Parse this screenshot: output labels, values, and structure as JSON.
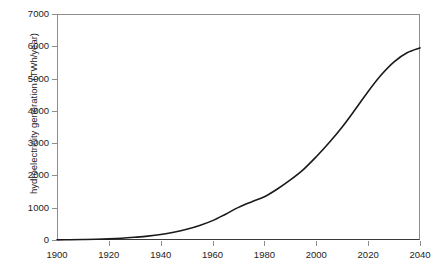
{
  "chart_data": {
    "type": "line",
    "title": "",
    "subtitle": "",
    "xlabel": "",
    "ylabel": "hydroelectricity generation (TWh/year)",
    "xlim": [
      1900,
      2040
    ],
    "ylim": [
      0,
      7000
    ],
    "xticks": [
      1900,
      1920,
      1940,
      1960,
      1980,
      2000,
      2020,
      2040
    ],
    "xtick_labels": [
      "1900",
      "1920",
      "1940",
      "1960",
      "1980",
      "2000",
      "2020",
      "2040"
    ],
    "yticks": [
      0,
      1000,
      2000,
      3000,
      4000,
      5000,
      6000,
      7000
    ],
    "ytick_labels": [
      "0",
      "1000",
      "2000",
      "3000",
      "4000",
      "5000",
      "6000",
      "7000"
    ],
    "grid": false,
    "legend": false,
    "legend_position": "none",
    "line_color": "#1a1a1a",
    "line_width": 1.6,
    "x": [
      1900,
      1905,
      1910,
      1915,
      1920,
      1925,
      1930,
      1935,
      1940,
      1945,
      1950,
      1955,
      1960,
      1965,
      1970,
      1975,
      1980,
      1985,
      1990,
      1995,
      2000,
      2005,
      2010,
      2015,
      2020,
      2025,
      2030,
      2035,
      2040
    ],
    "series": [
      {
        "name": "hydroelectricity generation",
        "values": [
          5,
          8,
          14,
          22,
          35,
          55,
          85,
          120,
          170,
          240,
          330,
          450,
          600,
          800,
          1010,
          1180,
          1340,
          1580,
          1860,
          2180,
          2580,
          3020,
          3500,
          4040,
          4600,
          5110,
          5520,
          5800,
          5950
        ]
      }
    ]
  },
  "axes": {
    "frame_color": "#8d8d8d",
    "baseline_color": "#3a3a3a",
    "tick_color": "#8d8d8d",
    "label_color": "#1d1d1d"
  },
  "canvas": {
    "background": "#ffffff"
  }
}
